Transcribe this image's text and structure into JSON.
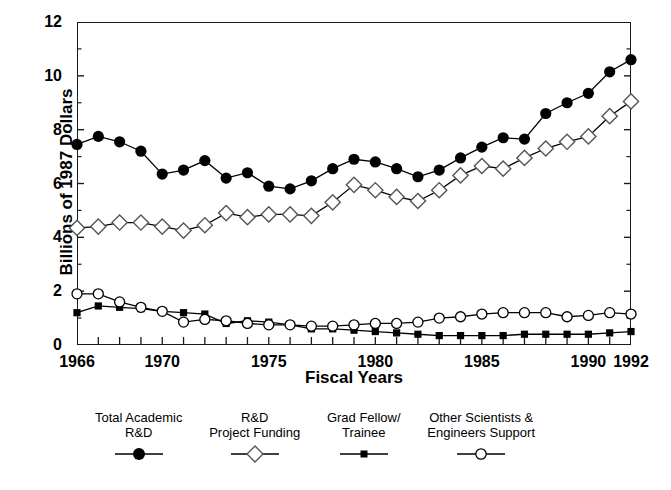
{
  "chart_data": {
    "type": "line",
    "title": "",
    "xlabel": "Fiscal Years",
    "ylabel": "Billions of 1987 Dollars",
    "xlim": [
      1966,
      1992
    ],
    "ylim": [
      0,
      12
    ],
    "yticks": [
      0,
      2,
      4,
      6,
      8,
      10,
      12
    ],
    "ytick_labels": [
      "0",
      "2",
      "4",
      "6",
      "8",
      "10",
      "12"
    ],
    "xticks": [
      1966,
      1970,
      1975,
      1980,
      1985,
      1990,
      1992
    ],
    "xtick_labels": [
      "1966",
      "1970",
      "1975",
      "1980",
      "1985",
      "1990",
      "1992"
    ],
    "x_minor_tick_interval": 1,
    "grid": false,
    "legend_position": "below-plot",
    "x": [
      1966,
      1967,
      1968,
      1969,
      1970,
      1971,
      1972,
      1973,
      1974,
      1975,
      1976,
      1977,
      1978,
      1979,
      1980,
      1981,
      1982,
      1983,
      1984,
      1985,
      1986,
      1987,
      1988,
      1989,
      1990,
      1991,
      1992
    ],
    "series": [
      {
        "name": "Total Academic R&D",
        "marker": "filled-circle",
        "color": "#000000",
        "values": [
          7.45,
          7.75,
          7.55,
          7.2,
          6.35,
          6.5,
          6.85,
          6.2,
          6.4,
          5.9,
          5.8,
          6.1,
          6.55,
          6.9,
          6.8,
          6.55,
          6.25,
          6.5,
          6.95,
          7.35,
          7.7,
          7.65,
          8.6,
          9.0,
          9.35,
          10.15,
          10.6
        ]
      },
      {
        "name": "R&D Project Funding",
        "marker": "open-diamond",
        "color": "#555555",
        "values": [
          4.35,
          4.4,
          4.55,
          4.55,
          4.4,
          4.25,
          4.45,
          4.9,
          4.75,
          4.85,
          4.85,
          4.8,
          5.3,
          5.95,
          5.75,
          5.5,
          5.35,
          5.75,
          6.3,
          6.65,
          6.55,
          6.95,
          7.3,
          7.55,
          7.75,
          8.5,
          9.05
        ]
      },
      {
        "name": "Grad Fellow/ Trainee",
        "marker": "filled-square",
        "color": "#000000",
        "values": [
          1.2,
          1.45,
          1.4,
          1.35,
          1.25,
          1.2,
          1.15,
          0.8,
          0.9,
          0.85,
          0.75,
          0.6,
          0.6,
          0.55,
          0.5,
          0.45,
          0.4,
          0.35,
          0.35,
          0.35,
          0.35,
          0.4,
          0.4,
          0.4,
          0.4,
          0.45,
          0.5
        ]
      },
      {
        "name": "Other Scientists & Engineers Support",
        "marker": "open-circle",
        "color": "#000000",
        "values": [
          1.9,
          1.9,
          1.6,
          1.4,
          1.25,
          0.85,
          0.95,
          0.9,
          0.8,
          0.75,
          0.75,
          0.7,
          0.7,
          0.75,
          0.8,
          0.8,
          0.85,
          1.0,
          1.05,
          1.15,
          1.2,
          1.2,
          1.2,
          1.05,
          1.1,
          1.2,
          1.15
        ]
      }
    ]
  },
  "axes": {
    "ylabel": "Billions of 1987 Dollars",
    "xlabel": "Fiscal Years"
  },
  "legend": {
    "entries": [
      {
        "line1": "Total Academic",
        "line2": "R&D",
        "marker": "filled-circle-marker"
      },
      {
        "line1": "R&D",
        "line2": "Project Funding",
        "marker": "open-diamond-marker"
      },
      {
        "line1": "Grad Fellow/",
        "line2": "Trainee",
        "marker": "filled-square-marker"
      },
      {
        "line1": "Other Scientists &",
        "line2": "Engineers Support",
        "marker": "open-circle-marker"
      }
    ]
  },
  "colors": {
    "axis": "#1a1a1a",
    "series_solid": "#000000",
    "series_diamond_outline": "#555555",
    "background": "#ffffff"
  }
}
